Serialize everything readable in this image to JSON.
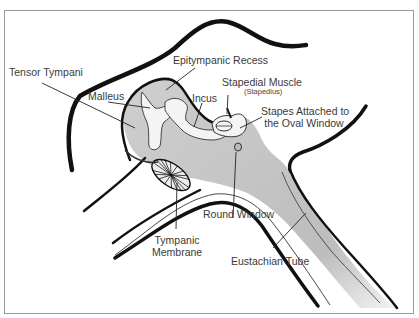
{
  "figure": {
    "colors": {
      "outline": "#111111",
      "cavity_fill": "#d6d6d6",
      "ossicle_fill": "#f4f4f4",
      "leader_line": "#222222",
      "label_text": "#3a3a3a",
      "frame_border": "#9a9a9a"
    }
  },
  "labels": {
    "epitympanic_recess": "Epitympanic Recess",
    "tensor_tympani": "Tensor Tympani",
    "malleus": "Malleus",
    "incus": "Incus",
    "stapedial_muscle": "Stapedial Muscle",
    "stapedius": "(Stapedius)",
    "stapes_line1": "Stapes Attached to",
    "stapes_line2": "the Oval Window",
    "round_window": "Round Window",
    "tympanic_line1": "Tympanic",
    "tympanic_line2": "Membrane",
    "eustachian_tube": "Eustachian Tube"
  }
}
